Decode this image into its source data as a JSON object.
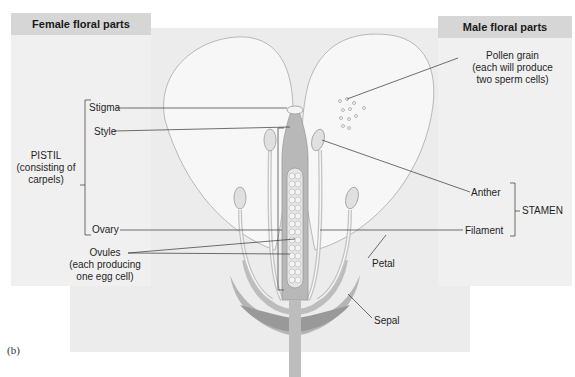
{
  "panels": {
    "female": {
      "title": "Female floral parts"
    },
    "male": {
      "title": "Male floral parts"
    }
  },
  "labels": {
    "stigma": "Stigma",
    "style": "Style",
    "pistil_line1": "PISTIL",
    "pistil_line2": "(consisting of",
    "pistil_line3": "carpels)",
    "ovary": "Ovary",
    "ovules_line1": "Ovules",
    "ovules_line2": "(each producing",
    "ovules_line3": "one egg cell)",
    "pollen_line1": "Pollen grain",
    "pollen_line2": "(each will produce",
    "pollen_line3": "two sperm cells)",
    "anther": "Anther",
    "filament": "Filament",
    "stamen": "STAMEN",
    "petal": "Petal",
    "sepal": "Sepal"
  },
  "figure_label": "(b)",
  "colors": {
    "panel_bg": "#efefef",
    "panel_header": "#d6d6d6",
    "petal_fill": "#f7f7f7",
    "tissue": "#bdbdbd",
    "tissue_dark": "#9a9a9a",
    "ovule": "#f2f2f2"
  }
}
